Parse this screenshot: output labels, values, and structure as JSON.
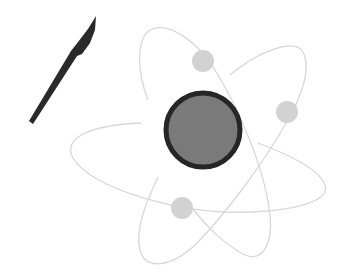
{
  "illustration": {
    "subject": "atom with scalpel",
    "colors": {
      "background": "#ffffff",
      "scalpel": "#2a2a2a",
      "nucleus_fill": "#7a7a7a",
      "nucleus_ring": "#262626",
      "orbit": "#d6d6d6",
      "electron": "#d2d2d2"
    },
    "nucleus": {
      "cx": 203,
      "cy": 130,
      "r": 37,
      "ring": 5
    },
    "electrons": [
      {
        "cx": 203,
        "cy": 61,
        "r": 11
      },
      {
        "cx": 287,
        "cy": 112,
        "r": 11
      },
      {
        "cx": 182,
        "cy": 208,
        "r": 11
      }
    ]
  }
}
